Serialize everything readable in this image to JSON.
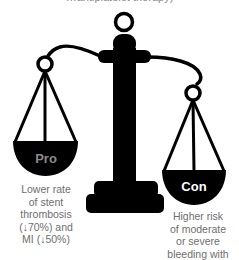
{
  "header": {
    "clipped_text": "…antiplatelet therapy)"
  },
  "scale": {
    "left_pan": {
      "label": "Pro",
      "label_color": "#8a8a8a",
      "pan_color": "#000000"
    },
    "right_pan": {
      "label": "Con",
      "label_color": "#ffffff",
      "pan_color": "#000000"
    }
  },
  "captions": {
    "pro": {
      "lines": [
        "Lower rate",
        "of stent",
        "thrombosis",
        "(↓70%) and",
        "MI (↓50%)"
      ]
    },
    "con": {
      "lines": [
        "Higher risk",
        "of moderate",
        "or severe",
        "bleeding with"
      ]
    }
  },
  "colors": {
    "ink": "#000000",
    "caption_text": "#6e6e6e",
    "background": "#ffffff"
  }
}
